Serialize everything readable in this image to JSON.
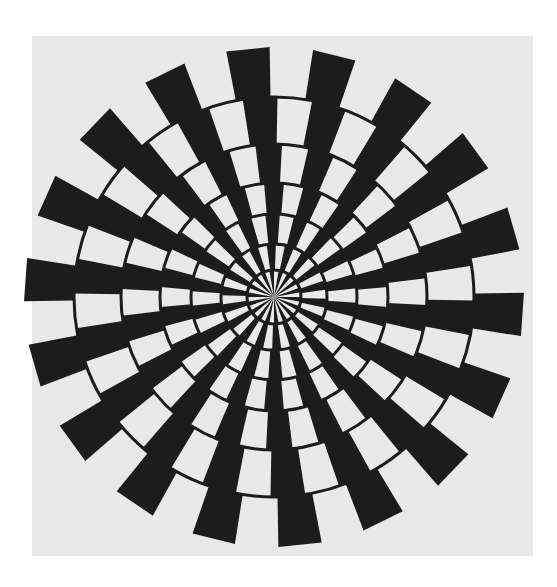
{
  "figure": {
    "panel": {
      "x": 32,
      "y": 36,
      "width": 501,
      "height": 520,
      "color": "#e9e9e9"
    },
    "page_background": "#ffffff",
    "center": {
      "x": 274,
      "y": 297
    },
    "spoke_count": 18,
    "spoke_width_deg": 10,
    "spoke_color": "#1c1c1c",
    "ring_color": "#1c1c1c",
    "ring_stroke_width": 3,
    "ring_radii": [
      27,
      53,
      83,
      114,
      153,
      200
    ],
    "outer_radius": 250,
    "band_rotation_offsets_deg": [
      0,
      2,
      4,
      5,
      3,
      1,
      -1
    ],
    "base_rotation_deg": -5
  }
}
